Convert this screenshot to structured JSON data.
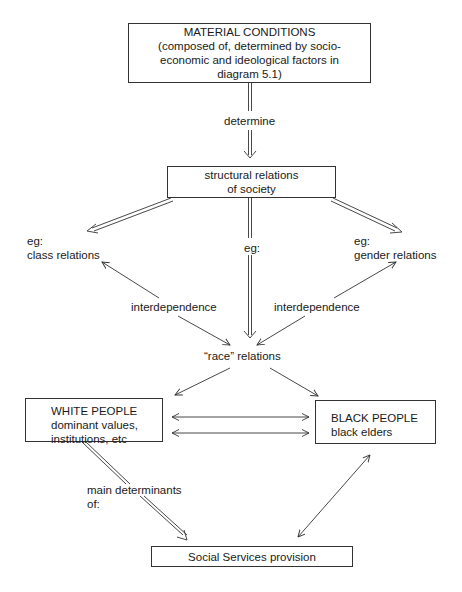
{
  "diagram": {
    "nodes": {
      "material_conditions": {
        "title": "MATERIAL CONDITIONS",
        "lines": [
          "(composed of, determined by socio-",
          "economic and ideological factors in",
          "diagram 5.1)"
        ]
      },
      "structural_relations": {
        "lines": [
          "structural relations",
          "of society"
        ]
      },
      "class_relations": {
        "lines": [
          "eg:",
          "class relations"
        ]
      },
      "gender_relations": {
        "lines": [
          "eg:",
          "gender relations"
        ]
      },
      "race_relations": {
        "label": "“race” relations"
      },
      "white_people": {
        "title": "WHITE PEOPLE",
        "lines": [
          "dominant values,",
          "institutions, etc"
        ]
      },
      "black_people": {
        "title": "BLACK PEOPLE",
        "lines": [
          "black elders"
        ]
      },
      "social_services": {
        "label": "Social Services provision"
      }
    },
    "edge_labels": {
      "determine": "determine",
      "eg_center": "eg:",
      "interdependence_left": "interdependence",
      "interdependence_right": "interdependence",
      "main_determinants": [
        "main determinants",
        "of:"
      ]
    },
    "edges": [
      {
        "from": "material_conditions",
        "to": "structural_relations",
        "style": "double",
        "label": "determine"
      },
      {
        "from": "structural_relations",
        "to": "class_relations",
        "style": "double"
      },
      {
        "from": "structural_relations",
        "to": "race_relations",
        "style": "double",
        "label": "eg:"
      },
      {
        "from": "structural_relations",
        "to": "gender_relations",
        "style": "double"
      },
      {
        "from": "race_relations",
        "to": "class_relations",
        "style": "bidirectional",
        "label": "interdependence"
      },
      {
        "from": "race_relations",
        "to": "gender_relations",
        "style": "bidirectional",
        "label": "interdependence"
      },
      {
        "from": "race_relations",
        "to": "white_people",
        "style": "single"
      },
      {
        "from": "race_relations",
        "to": "black_people",
        "style": "single"
      },
      {
        "from": "white_people",
        "to": "black_people",
        "style": "bidirectional-pair"
      },
      {
        "from": "white_people",
        "to": "social_services",
        "style": "double",
        "label": "main determinants of:"
      },
      {
        "from": "black_people",
        "to": "social_services",
        "style": "bidirectional"
      }
    ]
  }
}
